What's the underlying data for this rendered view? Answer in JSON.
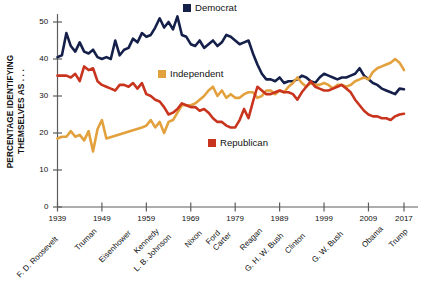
{
  "chart_data": {
    "type": "line",
    "title": "",
    "xlabel": "",
    "ylabel": "PERCENTAGE IDENTIFYING THEMSELVES AS . . .",
    "xlim": [
      1939,
      2017
    ],
    "ylim": [
      0,
      53
    ],
    "grid": false,
    "legend_position": "inline-annotations",
    "y_ticks": [
      "0",
      "10",
      "20",
      "30",
      "40",
      "50"
    ],
    "y_tick_values": [
      0,
      10,
      20,
      30,
      40,
      50
    ],
    "x_ticks": [
      "1939",
      "1949",
      "1959",
      "1969",
      "1979",
      "1989",
      "1999",
      "2009",
      "2017"
    ],
    "x_tick_values": [
      1939,
      1949,
      1959,
      1969,
      1979,
      1989,
      1999,
      2009,
      2017
    ],
    "presidents": [
      {
        "name": "F. D. Roosevelt",
        "year": 1940
      },
      {
        "name": "Truman",
        "year": 1947
      },
      {
        "name": "Eisenhower",
        "year": 1955
      },
      {
        "name": "Kennedy",
        "year": 1961
      },
      {
        "name": "L. B. Johnson",
        "year": 1965
      },
      {
        "name": "Nixon",
        "year": 1971
      },
      {
        "name": "Ford",
        "year": 1975
      },
      {
        "name": "Carter",
        "year": 1978
      },
      {
        "name": "Reagan",
        "year": 1984
      },
      {
        "name": "G. H. W. Bush",
        "year": 1990
      },
      {
        "name": "Clinton",
        "year": 1995
      },
      {
        "name": "G. W. Bush",
        "year": 2003
      },
      {
        "name": "Obama",
        "year": 2011
      },
      {
        "name": "Trump",
        "year": 2017
      }
    ],
    "series": [
      {
        "name": "Democrat",
        "color": "#15204a",
        "x": [
          1939,
          1940,
          1941,
          1942,
          1943,
          1944,
          1945,
          1946,
          1947,
          1948,
          1949,
          1950,
          1951,
          1952,
          1953,
          1954,
          1955,
          1956,
          1957,
          1958,
          1959,
          1960,
          1961,
          1962,
          1963,
          1964,
          1965,
          1966,
          1967,
          1968,
          1969,
          1970,
          1971,
          1972,
          1973,
          1974,
          1975,
          1976,
          1977,
          1978,
          1979,
          1980,
          1981,
          1982,
          1983,
          1984,
          1985,
          1986,
          1987,
          1988,
          1989,
          1990,
          1991,
          1992,
          1993,
          1994,
          1995,
          1996,
          1997,
          1998,
          1999,
          2000,
          2001,
          2002,
          2003,
          2004,
          2005,
          2006,
          2007,
          2008,
          2009,
          2010,
          2011,
          2012,
          2013,
          2014,
          2015,
          2016,
          2017
        ],
        "y": [
          40.5,
          41.0,
          47.0,
          43.5,
          42.0,
          44.5,
          42.0,
          41.5,
          42.5,
          40.5,
          40.0,
          40.5,
          40.0,
          45.0,
          41.0,
          42.5,
          43.0,
          45.5,
          44.5,
          47.0,
          46.0,
          46.5,
          48.5,
          51.0,
          48.5,
          50.0,
          48.0,
          51.5,
          46.5,
          46.0,
          44.0,
          43.5,
          45.0,
          43.0,
          44.0,
          45.0,
          43.5,
          44.5,
          46.5,
          46.0,
          45.0,
          44.0,
          44.5,
          45.0,
          41.5,
          38.5,
          36.0,
          34.5,
          34.5,
          34.0,
          35.0,
          33.5,
          34.0,
          34.0,
          34.5,
          35.5,
          35.0,
          34.0,
          33.5,
          35.0,
          36.0,
          35.5,
          35.0,
          34.5,
          35.0,
          35.0,
          35.5,
          36.0,
          37.5,
          35.5,
          34.5,
          33.5,
          33.0,
          32.0,
          31.5,
          31.0,
          30.5,
          32.0,
          31.8
        ]
      },
      {
        "name": "Independent",
        "color": "#e3a13d",
        "x": [
          1939,
          1940,
          1941,
          1942,
          1943,
          1944,
          1945,
          1946,
          1947,
          1948,
          1949,
          1950,
          1958,
          1959,
          1960,
          1961,
          1962,
          1963,
          1964,
          1965,
          1966,
          1967,
          1968,
          1969,
          1970,
          1971,
          1972,
          1973,
          1974,
          1975,
          1976,
          1977,
          1978,
          1979,
          1980,
          1981,
          1982,
          1983,
          1984,
          1985,
          1986,
          1987,
          1988,
          1989,
          1990,
          1991,
          1992,
          1993,
          1994,
          1995,
          1996,
          1997,
          1998,
          1999,
          2000,
          2001,
          2002,
          2003,
          2004,
          2005,
          2006,
          2007,
          2008,
          2009,
          2010,
          2011,
          2012,
          2013,
          2014,
          2015,
          2016,
          2017
        ],
        "y": [
          18.5,
          19.0,
          19.0,
          20.5,
          19.0,
          19.5,
          18.0,
          20.5,
          15.0,
          21.0,
          23.5,
          18.5,
          21.5,
          22.0,
          23.5,
          21.5,
          23.0,
          20.0,
          23.0,
          23.5,
          25.5,
          27.5,
          27.5,
          27.5,
          28.0,
          29.0,
          30.0,
          31.5,
          32.5,
          30.0,
          31.5,
          29.5,
          30.5,
          29.5,
          29.5,
          30.5,
          31.0,
          31.0,
          29.5,
          30.0,
          31.5,
          31.5,
          30.5,
          31.5,
          31.0,
          32.5,
          33.5,
          35.0,
          33.5,
          32.5,
          33.5,
          33.0,
          33.0,
          33.5,
          33.0,
          32.0,
          33.0,
          33.0,
          32.5,
          33.0,
          34.0,
          34.5,
          35.0,
          34.5,
          36.5,
          37.5,
          38.0,
          38.5,
          39.0,
          40.0,
          39.0,
          37.0
        ]
      },
      {
        "name": "Republican",
        "color": "#c8341e",
        "x": [
          1939,
          1940,
          1941,
          1942,
          1943,
          1944,
          1945,
          1946,
          1947,
          1948,
          1949,
          1950,
          1951,
          1952,
          1953,
          1954,
          1955,
          1956,
          1957,
          1958,
          1959,
          1960,
          1961,
          1962,
          1963,
          1964,
          1965,
          1966,
          1967,
          1968,
          1969,
          1970,
          1971,
          1972,
          1973,
          1974,
          1975,
          1976,
          1977,
          1978,
          1979,
          1980,
          1981,
          1982,
          1983,
          1984,
          1985,
          1986,
          1987,
          1988,
          1989,
          1990,
          1991,
          1992,
          1993,
          1994,
          1995,
          1996,
          1997,
          1998,
          1999,
          2000,
          2001,
          2002,
          2003,
          2004,
          2005,
          2006,
          2007,
          2008,
          2009,
          2010,
          2011,
          2012,
          2013,
          2014,
          2015,
          2016,
          2017
        ],
        "y": [
          35.5,
          35.5,
          35.5,
          35.0,
          36.0,
          34.0,
          38.0,
          37.0,
          37.5,
          34.0,
          33.0,
          32.5,
          32.0,
          31.5,
          33.0,
          33.0,
          32.5,
          33.5,
          32.0,
          33.5,
          30.5,
          30.0,
          29.0,
          28.5,
          27.0,
          25.0,
          25.5,
          26.5,
          28.0,
          27.5,
          27.0,
          27.0,
          26.0,
          26.5,
          25.5,
          24.0,
          23.0,
          23.0,
          22.0,
          21.5,
          21.5,
          23.5,
          26.5,
          24.0,
          28.5,
          32.5,
          31.5,
          30.5,
          30.5,
          31.0,
          31.5,
          31.0,
          31.0,
          30.5,
          29.0,
          31.0,
          32.5,
          34.0,
          32.5,
          32.0,
          31.5,
          31.5,
          32.0,
          32.5,
          33.0,
          32.0,
          31.0,
          29.0,
          27.5,
          26.0,
          25.0,
          24.5,
          24.5,
          24.0,
          24.0,
          23.5,
          24.5,
          25.0,
          25.2
        ]
      }
    ]
  },
  "legend": {
    "democrat": {
      "label": "Democrat",
      "color": "#15204a"
    },
    "independent": {
      "label": "Independent",
      "color": "#e3a13d"
    },
    "republican": {
      "label": "Republican",
      "color": "#c8341e"
    }
  },
  "axis": {
    "y_title_line1": "PERCENTAGE IDENTIFYING",
    "y_title_line2": "THEMSELVES AS . . ."
  },
  "caption": {
    "text": ""
  }
}
